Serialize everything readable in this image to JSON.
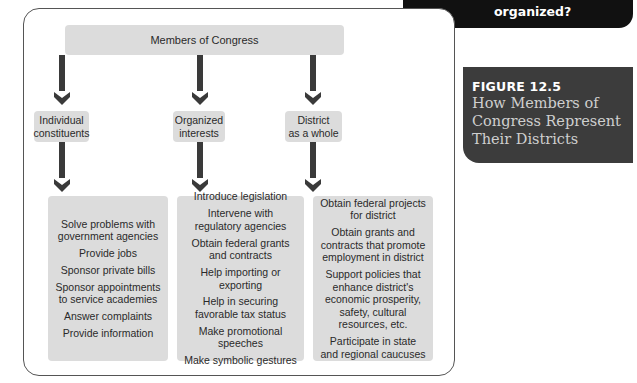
{
  "header_tag": {
    "text": "organized?"
  },
  "figure": {
    "number": "FIGURE 12.5",
    "title": "How Members of\nCongress Represent\nTheir Districts"
  },
  "diagram": {
    "root": "Members of Congress",
    "columns": [
      {
        "heading": "Individual\nconstituents",
        "items": [
          "Solve problems with\ngovernment agencies",
          "Provide jobs",
          "Sponsor private bills",
          "Sponsor appointments\nto service academies",
          "Answer complaints",
          "Provide information"
        ]
      },
      {
        "heading": "Organized\ninterests",
        "items": [
          "Introduce legislation",
          "Intervene with\nregulatory agencies",
          "Obtain federal grants\nand contracts",
          "Help importing or\nexporting",
          "Help in securing\nfavorable tax status",
          "Make promotional speeches",
          "Make symbolic gestures"
        ]
      },
      {
        "heading": "District\nas a whole",
        "items": [
          "Obtain federal projects\nfor district",
          "Obtain grants and\ncontracts that promote\nemployment in district",
          "Support policies that\nenhance district's\neconomic prosperity,\nsafety, cultural\nresources, etc.",
          "Participate in state\nand regional caucuses"
        ]
      }
    ]
  }
}
